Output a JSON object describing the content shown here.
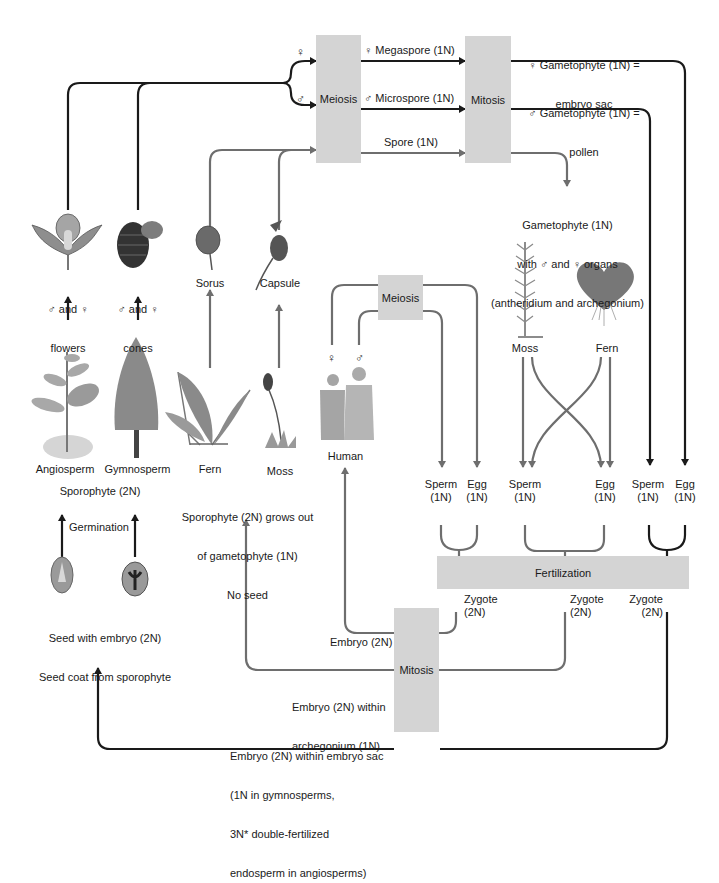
{
  "colors": {
    "black_arrow": "#1a1a1a",
    "gray_arrow": "#6e6e6e",
    "box_fill": "#d4d4d4",
    "background": "#ffffff"
  },
  "process_boxes": {
    "meiosis_top": "Meiosis",
    "mitosis_top": "Mitosis",
    "meiosis_human": "Meiosis",
    "fertilization": "Fertilization",
    "mitosis_bottom": "Mitosis"
  },
  "symbols": {
    "female": "♀",
    "male": "♂"
  },
  "top_flow": {
    "megaspore": "♀ Megaspore (1N)",
    "microspore": "♂ Microspore (1N)",
    "spore": "Spore (1N)",
    "female_gametophyte_line1": "♀ Gametophyte (1N) =",
    "female_gametophyte_line2": "embryo sac",
    "male_gametophyte_line1": "♂ Gametophyte (1N) =",
    "male_gametophyte_line2": "pollen"
  },
  "gametophyte_note": {
    "line1": "Gametophyte (1N)",
    "line2": "with ♂ and ♀ organs",
    "line3": "(antheridium and archegonium)"
  },
  "structures": {
    "flowers_line1": "♂ and ♀",
    "flowers_line2": "flowers",
    "cones_line1": "♂ and ♀",
    "cones_line2": "cones",
    "sorus": "Sorus",
    "capsule": "Capsule"
  },
  "sporophytes": {
    "angiosperm": "Angiosperm",
    "gymnosperm": "Gymnosperm",
    "fern": "Fern",
    "moss": "Moss",
    "human": "Human",
    "sporophyte_2n": "Sporophyte (2N)",
    "fern_moss_note_line1": "Sporophyte (2N) grows out",
    "fern_moss_note_line2": "of gametophyte (1N)",
    "fern_moss_note_line3": "No seed"
  },
  "gametophytes": {
    "moss": "Moss",
    "fern": "Fern"
  },
  "seeds": {
    "germination": "Germination",
    "line1": "Seed with embryo (2N)",
    "line2": "Seed coat from sporophyte"
  },
  "gametes": [
    {
      "sperm": "Sperm",
      "egg": "Egg",
      "ploidy": "(1N)"
    },
    {
      "sperm": "Sperm",
      "egg": "Egg",
      "ploidy": "(1N)"
    },
    {
      "sperm": "Sperm",
      "egg": "Egg",
      "ploidy": "(1N)"
    }
  ],
  "zygotes": [
    {
      "label": "Zygote",
      "ploidy": "(2N)"
    },
    {
      "label": "Zygote",
      "ploidy": "(2N)"
    },
    {
      "label": "Zygote",
      "ploidy": "(2N)"
    }
  ],
  "embryos": {
    "human": "Embryo (2N)",
    "archegonium_line1": "Embryo (2N) within",
    "archegonium_line2": "archegonium (1N)",
    "embryo_sac_line1": "Embryo (2N) within embryo sac",
    "embryo_sac_line2": "(1N in gymnosperms,",
    "embryo_sac_line3": "3N* double-fertilized",
    "embryo_sac_line4": "endosperm in angiosperms)"
  }
}
